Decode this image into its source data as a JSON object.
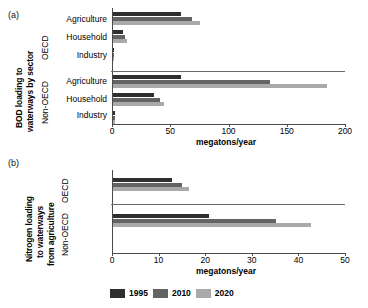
{
  "figure": {
    "panel_a_tag": "(a)",
    "panel_b_tag": "(b)"
  },
  "legend": {
    "position": "bottom-center",
    "entries": [
      {
        "label": "1995",
        "color": "#2f2f2f"
      },
      {
        "label": "2010",
        "color": "#636363"
      },
      {
        "label": "2020",
        "color": "#a9a9a9"
      }
    ]
  },
  "panel_a": {
    "ytitle_line1": "BOD loading to",
    "ytitle_line2": "waterways by sector",
    "group_labels": [
      "OECD",
      "Non-OECD"
    ],
    "categories": [
      "Agriculture",
      "Household",
      "Industry"
    ],
    "xlabel": "megatons/year",
    "ticklabels": [
      "0",
      "50",
      "100",
      "150",
      "200"
    ]
  },
  "panel_b": {
    "ytitle_line1": "Nitrogen loading",
    "ytitle_line2": "to waterways",
    "ytitle_line3": "from agriculture",
    "group_labels": [
      "OECD",
      "Non-OECD"
    ],
    "xlabel": "megatons/year",
    "ticklabels": [
      "0",
      "10",
      "20",
      "30",
      "40",
      "50"
    ]
  },
  "chart_data": [
    {
      "type": "bar",
      "orientation": "horizontal",
      "title": "BOD loading to waterways by sector",
      "xlabel": "megatons/year",
      "ylabel": "BOD loading to waterways by sector",
      "xlim": [
        0,
        200
      ],
      "xticks": [
        0,
        50,
        100,
        150,
        200
      ],
      "grid": false,
      "legend_position": "bottom-center",
      "groups": [
        {
          "name": "OECD",
          "categories": [
            "Agriculture",
            "Household",
            "Industry"
          ],
          "series": [
            {
              "name": "1995",
              "color": "#2f2f2f",
              "values": [
                58,
                9,
                1
              ]
            },
            {
              "name": "2010",
              "color": "#636363",
              "values": [
                68,
                10,
                1
              ]
            },
            {
              "name": "2020",
              "color": "#a9a9a9",
              "values": [
                75,
                12,
                1
              ]
            }
          ]
        },
        {
          "name": "Non-OECD",
          "categories": [
            "Agriculture",
            "Household",
            "Industry"
          ],
          "series": [
            {
              "name": "1995",
              "color": "#2f2f2f",
              "values": [
                58,
                35,
                1.5
              ]
            },
            {
              "name": "2010",
              "color": "#636363",
              "values": [
                135,
                40,
                1.5
              ]
            },
            {
              "name": "2020",
              "color": "#a9a9a9",
              "values": [
                184,
                44,
                2
              ]
            }
          ]
        }
      ]
    },
    {
      "type": "bar",
      "orientation": "horizontal",
      "title": "Nitrogen loading to waterways from agriculture",
      "xlabel": "megatons/year",
      "ylabel": "Nitrogen loading to waterways from agriculture",
      "xlim": [
        0,
        50
      ],
      "xticks": [
        0,
        10,
        20,
        30,
        40,
        50
      ],
      "grid": false,
      "legend_position": "bottom-center",
      "groups": [
        {
          "name": "OECD",
          "categories": [
            "Agriculture"
          ],
          "series": [
            {
              "name": "1995",
              "color": "#2f2f2f",
              "values": [
                12.7
              ]
            },
            {
              "name": "2010",
              "color": "#636363",
              "values": [
                14.8
              ]
            },
            {
              "name": "2020",
              "color": "#a9a9a9",
              "values": [
                16.3
              ]
            }
          ]
        },
        {
          "name": "Non-OECD",
          "categories": [
            "Agriculture"
          ],
          "series": [
            {
              "name": "1995",
              "color": "#2f2f2f",
              "values": [
                20.5
              ]
            },
            {
              "name": "2010",
              "color": "#636363",
              "values": [
                35.0
              ]
            },
            {
              "name": "2020",
              "color": "#a9a9a9",
              "values": [
                42.5
              ]
            }
          ]
        }
      ]
    }
  ]
}
